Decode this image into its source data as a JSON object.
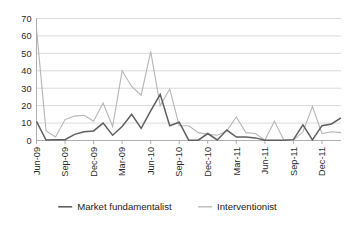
{
  "chart_data": {
    "type": "line",
    "title": "",
    "subtitle": "",
    "xlabel": "",
    "ylabel": "",
    "ylim": [
      0,
      70
    ],
    "ytick_values": [
      0,
      10,
      20,
      30,
      40,
      50,
      60,
      70
    ],
    "ytick_labels": [
      "0",
      "10",
      "20",
      "30",
      "40",
      "50",
      "60",
      "70"
    ],
    "grid": true,
    "grid_axis": "y",
    "legend_position": "bottom",
    "x_tick_labels": [
      "Jun-09",
      "Sep-09",
      "Dec-09",
      "Mar-09",
      "Jun-10",
      "Sep-10",
      "Dec-10",
      "Mar-11",
      "Jun-11",
      "Sep-11",
      "Dec-11"
    ],
    "x_tick_indices": [
      0,
      3,
      6,
      9,
      12,
      15,
      18,
      21,
      24,
      27,
      30
    ],
    "n_points": 33,
    "series": [
      {
        "name": "Market fundamentalist",
        "color": "#5f5f5f",
        "values": [
          11,
          0.3,
          0.5,
          0.5,
          3.5,
          5,
          5.5,
          10,
          3,
          8,
          15,
          7,
          17,
          26.5,
          8.5,
          10.5,
          0.2,
          0.2,
          4,
          0.3,
          6,
          2,
          2,
          1.5,
          0.2,
          0.2,
          0.2,
          0.5,
          9,
          0.3,
          8.5,
          9.5,
          13
        ]
      },
      {
        "name": "Interventionist",
        "color": "#b6b6b6",
        "values": [
          64,
          5.5,
          2,
          12,
          14,
          14.5,
          11,
          21.5,
          8,
          40,
          31,
          26,
          51,
          20,
          29.5,
          8.5,
          8.5,
          4.5,
          3.5,
          3,
          5.5,
          13.5,
          4.5,
          4,
          0.2,
          11,
          0.2,
          0.2,
          5,
          19.5,
          4,
          5,
          4.5
        ]
      }
    ]
  },
  "legend": {
    "entries": [
      {
        "label": "Market fundamentalist",
        "color": "#5f5f5f"
      },
      {
        "label": "Interventionist",
        "color": "#b6b6b6"
      }
    ]
  }
}
